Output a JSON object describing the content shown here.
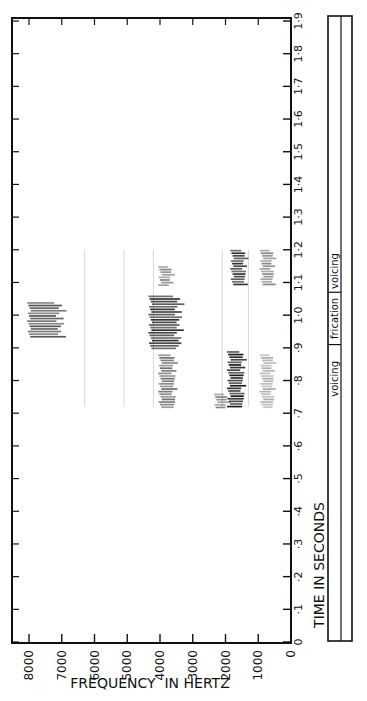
{
  "chart_data": {
    "type": "heatmap",
    "title": "",
    "subtitle": "Speech spectrogram (rotated 90°): time runs bottom-to-top, frequency decreases left-to-right",
    "xlabel": "FREQUENCY IN HERTZ",
    "ylabel": "TIME IN SECONDS",
    "x_axis": {
      "ticks": [
        8000,
        7000,
        6000,
        5000,
        4000,
        3000,
        2000,
        1000,
        0
      ],
      "tick_labels": [
        "8000",
        "7000",
        "6000",
        "5000",
        "4000",
        "3000",
        "2000",
        "1000",
        "0"
      ],
      "range": [
        8400,
        0
      ]
    },
    "y_axis": {
      "ticks": [
        0,
        0.1,
        0.2,
        0.3,
        0.4,
        0.5,
        0.6,
        0.7,
        0.8,
        0.9,
        1.0,
        1.1,
        1.2,
        1.3,
        1.4,
        1.5,
        1.6,
        1.7,
        1.8,
        1.9
      ],
      "tick_labels": [
        "0",
        "·1",
        "·2",
        "·3",
        "·4",
        "·5",
        "·6",
        "·7",
        "·8",
        "·9",
        "1·0",
        "1·1",
        "1·2",
        "1·3",
        "1·4",
        "1·5",
        "1·6",
        "1·7",
        "1·8",
        "1·9"
      ],
      "range": [
        0,
        1.93
      ]
    },
    "grid": false,
    "legend": null,
    "segment_labels": [
      {
        "label": "voicing",
        "t_start": 0.7,
        "t_end": 0.91
      },
      {
        "label": "frication",
        "t_start": 0.91,
        "t_end": 1.07
      },
      {
        "label": "voicing",
        "t_start": 1.07,
        "t_end": 1.2
      }
    ],
    "energy_regions": [
      {
        "name": "F1 voicing band 1",
        "f_low": 1400,
        "f_high": 1900,
        "t_start": 0.72,
        "t_end": 0.89,
        "intensity": 0.95
      },
      {
        "name": "F1 voicing low onset",
        "f_low": 1900,
        "f_high": 2300,
        "t_start": 0.72,
        "t_end": 0.76,
        "intensity": 0.5
      },
      {
        "name": "F0/low band 1",
        "f_low": 500,
        "f_high": 900,
        "t_start": 0.72,
        "t_end": 0.88,
        "intensity": 0.35
      },
      {
        "name": "F3 voicing band 1",
        "f_low": 3500,
        "f_high": 4000,
        "t_start": 0.72,
        "t_end": 0.88,
        "intensity": 0.6
      },
      {
        "name": "frication mid",
        "f_low": 3300,
        "f_high": 4300,
        "t_start": 0.9,
        "t_end": 1.06,
        "intensity": 0.85
      },
      {
        "name": "frication high",
        "f_low": 6900,
        "f_high": 8000,
        "t_start": 0.93,
        "t_end": 1.04,
        "intensity": 0.7
      },
      {
        "name": "F1 voicing band 2",
        "f_low": 1350,
        "f_high": 1800,
        "t_start": 1.09,
        "t_end": 1.2,
        "intensity": 0.85
      },
      {
        "name": "F0/low band 2",
        "f_low": 500,
        "f_high": 900,
        "t_start": 1.09,
        "t_end": 1.2,
        "intensity": 0.5
      },
      {
        "name": "F3 voicing band 2",
        "f_low": 3600,
        "f_high": 4000,
        "t_start": 1.09,
        "t_end": 1.15,
        "intensity": 0.5
      }
    ],
    "faint_vertical_lines_hz": [
      6300,
      5100,
      4200,
      2100,
      1300
    ]
  },
  "labels": {
    "freq_title": "FREQUENCY  IN HERTZ",
    "time_title": "TIME IN SECONDS"
  }
}
